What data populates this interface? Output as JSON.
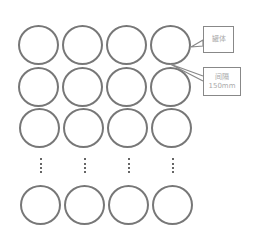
{
  "diagram": {
    "rows_visible": 4,
    "columns": 4,
    "ellipsis": "⋮",
    "callouts": [
      {
        "label": "罐体"
      },
      {
        "line1": "间隔",
        "line2": "150mm"
      }
    ]
  }
}
